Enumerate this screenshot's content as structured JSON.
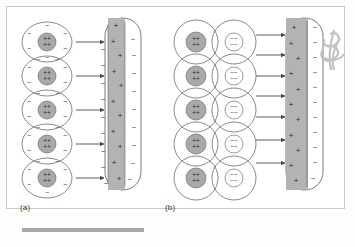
{
  "figure": {
    "title": "Dielectric polarization at a charged plate",
    "panels": [
      {
        "id": "a",
        "label": "(a)",
        "description": "Nonpolar atoms polarized by the field of a positively charged plate",
        "atom_rows": 5,
        "atom_columns": 1,
        "core_symbol": "++",
        "core_charge": "positive",
        "shell_symbol": "−",
        "shell_symbol_count_per_atom": 6,
        "arrow_count": 5,
        "arrow_direction": "right",
        "plate": {
          "shape": "rounded-capsule",
          "charged_strip_side": "left",
          "strip_symbol": "+",
          "strip_symbol_count": 11,
          "left_edge_symbol": "−",
          "left_edge_symbol_count": 9,
          "right_edge_symbol": "−",
          "right_edge_symbol_count": 9
        }
      },
      {
        "id": "b",
        "label": "(b)",
        "description": "Polar molecules aligned by the field of a positively charged plate",
        "atom_rows": 5,
        "atom_columns": 2,
        "left_core_symbol": "++",
        "left_core_charge": "positive",
        "right_core_symbol": "−−",
        "right_core_charge": "negative",
        "arrow_count": 7,
        "arrow_direction": "right",
        "plate": {
          "shape": "rounded-capsule",
          "charged_strip_side": "left",
          "strip_symbol": "+",
          "strip_symbol_count": 11,
          "right_edge_symbol": "−",
          "right_edge_symbol_count": 11
        }
      }
    ],
    "annotation": {
      "name": "pencil-scribble",
      "position": "right-edge",
      "text": ""
    }
  },
  "colors": {
    "page_background": "#fdfdfd",
    "frame_border": "#c9c9c9",
    "outline": "#58585a",
    "core_fill": "#a9a9a9",
    "plate_strip_fill": "#b3b3b3",
    "symbol": "#3a3a3a",
    "rule": "#a8a8a8",
    "scribble": "#b9b9b9"
  }
}
